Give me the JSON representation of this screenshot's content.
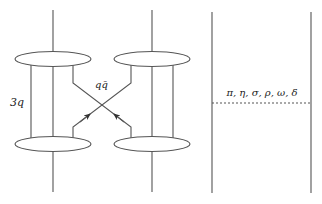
{
  "diagram": {
    "type": "quark-exchange-diagram",
    "labels": {
      "three_quark": "3q",
      "quark_antiquark": "qq̄",
      "mesons": "π, η, σ, ρ, ω, δ"
    },
    "colors": {
      "stroke": "#555555",
      "text": "#222222",
      "background": "#ffffff"
    },
    "elements": {
      "baryon_blobs": 4,
      "vertical_quark_lines_per_baryon": 3,
      "exchanged_pair": "qq̄ crossing with arrows",
      "meson_exchange_panel": "two vertical lines joined by dashed line"
    }
  }
}
